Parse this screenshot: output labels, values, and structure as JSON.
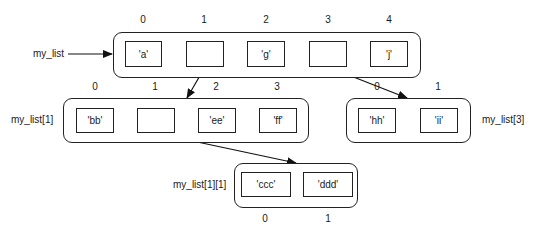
{
  "lists": {
    "my_list": {
      "name": "my_list",
      "indices": [
        "0",
        "1",
        "2",
        "3",
        "4"
      ],
      "cells": [
        "'a'",
        "",
        "'g'",
        "",
        "'j'"
      ]
    },
    "my_list_1": {
      "name": "my_list[1]",
      "indices": [
        "0",
        "1",
        "2",
        "3"
      ],
      "cells": [
        "'bb'",
        "",
        "'ee'",
        "'ff'"
      ]
    },
    "my_list_3": {
      "name": "my_list[3]",
      "indices": [
        "0",
        "1"
      ],
      "cells": [
        "'hh'",
        "'ii'"
      ]
    },
    "my_list_1_1": {
      "name": "my_list[1][1]",
      "indices": [
        "0",
        "1"
      ],
      "cells": [
        "'ccc'",
        "'ddd'"
      ]
    }
  },
  "colors": {
    "stroke": "#222222",
    "background": "#ffffff"
  }
}
